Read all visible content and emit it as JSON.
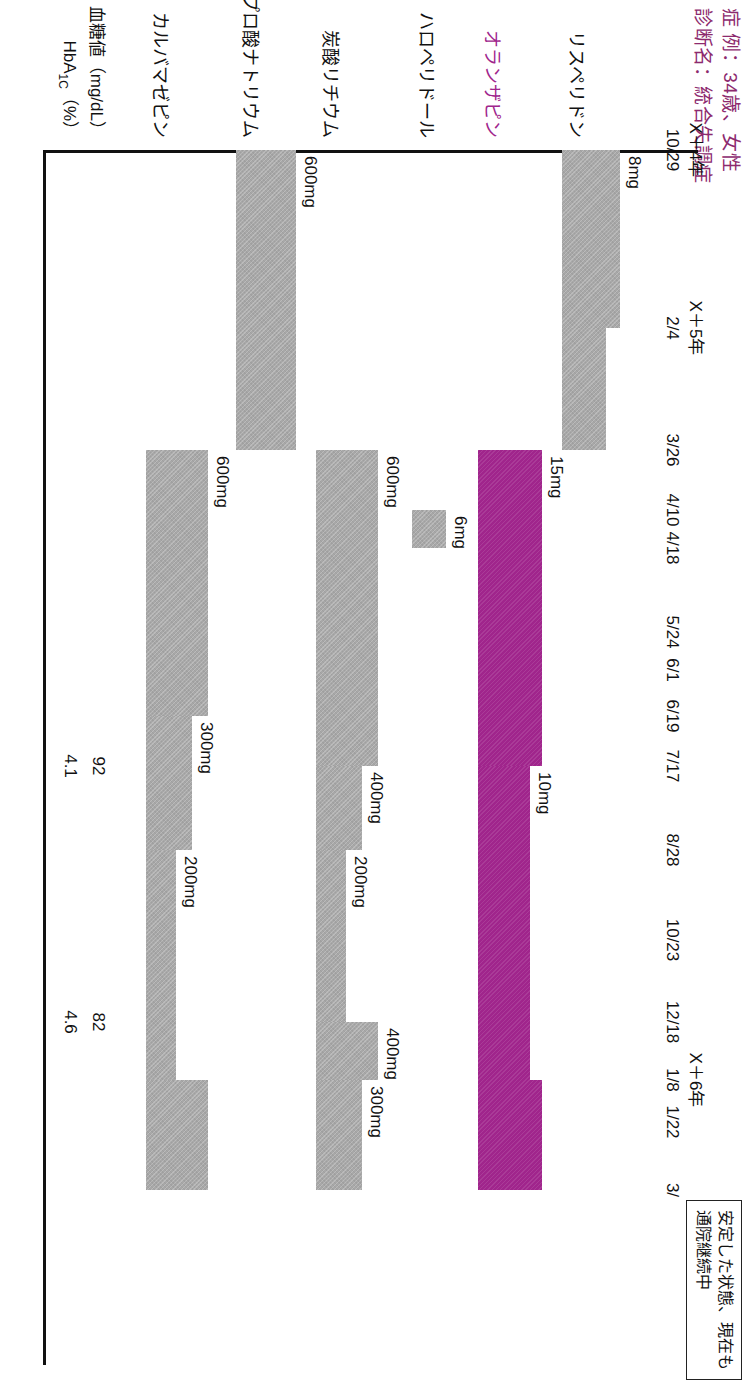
{
  "case_header": {
    "line1": "症 例：34歳、女性",
    "line2": "診断名：統合失調症"
  },
  "note_box": {
    "line1": "安定した状態、現在も",
    "line2": "通院継続中"
  },
  "chart_data": {
    "type": "table",
    "axis": {
      "x_positions_px": [
        0,
        178,
        300,
        360,
        398,
        482,
        520,
        566,
        616,
        700,
        790,
        872,
        930,
        972,
        1040
      ],
      "tick_labels": [
        "10/29",
        "2/4",
        "3/26",
        "4/10",
        "4/18",
        "5/24",
        "6/1",
        "6/19",
        "7/17",
        "8/28",
        "10/23",
        "12/18",
        "1/8",
        "1/22",
        "3/"
      ],
      "year_markers": [
        {
          "label": "X＋4年",
          "at_index": 0
        },
        {
          "label": "X＋5年",
          "at_index": 1
        },
        {
          "label": "X＋6年",
          "at_index": 12
        }
      ]
    },
    "rows": [
      {
        "name": "リスペリドン",
        "accent": false,
        "segments": [
          {
            "start_index": 0,
            "end_index": 1,
            "height": 58,
            "dose": "8mg"
          },
          {
            "start_index": 1,
            "end_index": 2,
            "height": 44,
            "dose": ""
          }
        ]
      },
      {
        "name": "オランザピン",
        "accent": true,
        "segments": [
          {
            "start_index": 2,
            "end_index": 8,
            "height": 64,
            "dose": "15mg"
          },
          {
            "start_index": 8,
            "end_index": 12,
            "height": 52,
            "dose": "10mg"
          },
          {
            "start_index": 12,
            "end_index": 14,
            "height": 64,
            "dose": ""
          }
        ]
      },
      {
        "name": "ハロペリドール",
        "accent": false,
        "segments": [
          {
            "start_index": 3,
            "end_index": 4,
            "height": 34,
            "dose": "6mg"
          }
        ]
      },
      {
        "name": "炭酸リチウム",
        "accent": false,
        "segments": [
          {
            "start_index": 2,
            "end_index": 8,
            "height": 62,
            "dose": "600mg"
          },
          {
            "start_index": 8,
            "end_index": 9,
            "height": 46,
            "dose": "400mg"
          },
          {
            "start_index": 9,
            "end_index": 11,
            "height": 30,
            "dose": "200mg"
          },
          {
            "start_index": 11,
            "end_index": 12,
            "height": 62,
            "dose": "400mg"
          },
          {
            "start_index": 12,
            "end_index": 14,
            "height": 46,
            "dose": "300mg"
          }
        ]
      },
      {
        "name": "バルプロ酸ナトリウム",
        "accent": false,
        "segments": [
          {
            "start_index": 0,
            "end_index": 2,
            "height": 60,
            "dose": "600mg"
          }
        ]
      },
      {
        "name": "カルバマゼピン",
        "accent": false,
        "segments": [
          {
            "start_index": 2,
            "end_index": 7,
            "height": 62,
            "dose": "600mg"
          },
          {
            "start_index": 7,
            "end_index": 9,
            "height": 46,
            "dose": "300mg"
          },
          {
            "start_index": 9,
            "end_index": 12,
            "height": 30,
            "dose": "200mg"
          },
          {
            "start_index": 12,
            "end_index": 14,
            "height": 62,
            "dose": ""
          }
        ]
      }
    ],
    "lab_rows": [
      {
        "label": "血糖値（mg/dL）",
        "values": [
          {
            "at_index": 8,
            "value": "92"
          },
          {
            "at_index": 11,
            "value": "82"
          }
        ]
      },
      {
        "label": "HbA1c（%）",
        "values": [
          {
            "at_index": 8,
            "value": "4.1"
          },
          {
            "at_index": 11,
            "value": "4.6"
          }
        ]
      }
    ],
    "colors": {
      "accent": "#a0258c",
      "bar_gray": "#a8a8a8",
      "axis": "#111111",
      "background": "#ffffff"
    }
  }
}
